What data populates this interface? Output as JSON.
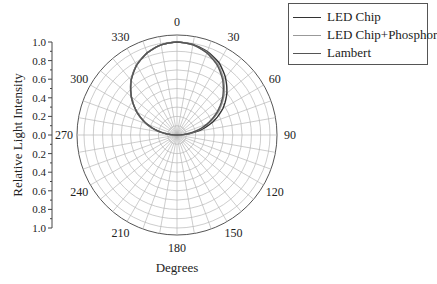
{
  "chart_data": {
    "type": "polar-line",
    "title": "",
    "xlabel": "Degrees",
    "ylabel": "Relative Light Intensity",
    "y_ticks": [
      "1.0",
      "0.8",
      "0.6",
      "0.4",
      "0.2",
      "0.0",
      "0.2",
      "0.4",
      "0.6",
      "0.8",
      "1.0"
    ],
    "angle_labels": [
      "0",
      "30",
      "60",
      "90",
      "120",
      "150",
      "180",
      "210",
      "240",
      "270",
      "300",
      "330"
    ],
    "angle_direction": "clockwise",
    "angle_zero": "top",
    "radial_range": [
      0,
      1.0
    ],
    "radial_grid_step": 0.1,
    "angular_grid_step_deg": 10,
    "grid": true,
    "legend_position": "upper right",
    "series": [
      {
        "name": "LED Chip",
        "color": "#333333",
        "angles": [
          -90,
          -80,
          -70,
          -60,
          -50,
          -40,
          -30,
          -20,
          -10,
          0,
          10,
          20,
          30,
          40,
          50,
          60,
          70,
          80,
          90
        ],
        "values": [
          0.0,
          0.18,
          0.35,
          0.5,
          0.64,
          0.77,
          0.87,
          0.94,
          0.985,
          1.0,
          0.99,
          0.955,
          0.9,
          0.81,
          0.7,
          0.57,
          0.41,
          0.22,
          0.0
        ]
      },
      {
        "name": "LED Chip+Phosphor",
        "color": "#999999",
        "angles": [
          -90,
          -80,
          -70,
          -60,
          -50,
          -40,
          -30,
          -20,
          -10,
          0,
          10,
          20,
          30,
          40,
          50,
          60,
          70,
          80,
          90
        ],
        "values": [
          0.0,
          0.18,
          0.35,
          0.5,
          0.645,
          0.77,
          0.87,
          0.94,
          0.985,
          1.0,
          0.985,
          0.945,
          0.88,
          0.78,
          0.66,
          0.52,
          0.36,
          0.19,
          0.0
        ]
      },
      {
        "name": "Lambert",
        "color": "#555555",
        "angles": [
          -90,
          -80,
          -70,
          -60,
          -50,
          -40,
          -30,
          -20,
          -10,
          0,
          10,
          20,
          30,
          40,
          50,
          60,
          70,
          80,
          90
        ],
        "values": [
          0.0,
          0.174,
          0.342,
          0.5,
          0.643,
          0.766,
          0.866,
          0.94,
          0.985,
          1.0,
          0.985,
          0.94,
          0.866,
          0.766,
          0.643,
          0.5,
          0.342,
          0.174,
          0.0
        ]
      }
    ]
  },
  "legend": {
    "items": [
      {
        "label": "LED Chip"
      },
      {
        "label": "LED Chip+Phosphor"
      },
      {
        "label": "Lambert"
      }
    ]
  }
}
